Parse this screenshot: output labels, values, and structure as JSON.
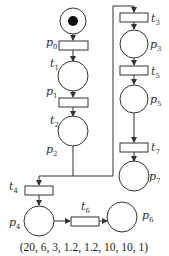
{
  "diagram": {
    "type": "petri-net",
    "caption": "(20, 6, 3, 1.2, 1.2, 10, 10, 1)",
    "places": [
      {
        "id": "p0",
        "label": "p",
        "sub": "0",
        "tokens": 1
      },
      {
        "id": "p1",
        "label": "p",
        "sub": "1",
        "tokens": 0
      },
      {
        "id": "p2",
        "label": "p",
        "sub": "2",
        "tokens": 0
      },
      {
        "id": "p3",
        "label": "p",
        "sub": "3",
        "tokens": 0
      },
      {
        "id": "p4",
        "label": "p",
        "sub": "4",
        "tokens": 0
      },
      {
        "id": "p5",
        "label": "p",
        "sub": "5",
        "tokens": 0
      },
      {
        "id": "p6",
        "label": "p",
        "sub": "6",
        "tokens": 0
      },
      {
        "id": "p7",
        "label": "p",
        "sub": "7",
        "tokens": 0
      }
    ],
    "transitions": [
      {
        "id": "t1",
        "label": "t",
        "sub": "1"
      },
      {
        "id": "t2",
        "label": "t",
        "sub": "2"
      },
      {
        "id": "t3",
        "label": "t",
        "sub": "3"
      },
      {
        "id": "t4",
        "label": "t",
        "sub": "4"
      },
      {
        "id": "t5",
        "label": "t",
        "sub": "5"
      },
      {
        "id": "t6",
        "label": "t",
        "sub": "6"
      },
      {
        "id": "t7",
        "label": "t",
        "sub": "7"
      }
    ],
    "arcs": [
      [
        "p0",
        "t1"
      ],
      [
        "t1",
        "p1"
      ],
      [
        "p1",
        "t2"
      ],
      [
        "t2",
        "p2"
      ],
      [
        "p2",
        "t3"
      ],
      [
        "t3",
        "p3"
      ],
      [
        "p3",
        "t5"
      ],
      [
        "t5",
        "p5"
      ],
      [
        "p5",
        "t7"
      ],
      [
        "t7",
        "p7"
      ],
      [
        "p2",
        "t4"
      ],
      [
        "t4",
        "p4"
      ],
      [
        "p4",
        "t6"
      ],
      [
        "t6",
        "p6"
      ]
    ],
    "colors": {
      "stroke": "#333333",
      "token": "#111111",
      "background": "#ffffff"
    }
  }
}
